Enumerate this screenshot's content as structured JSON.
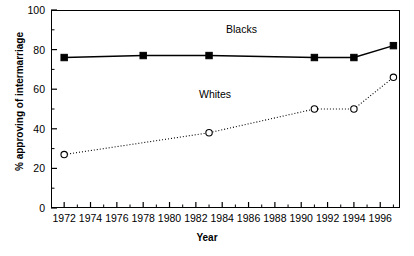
{
  "chart_data": {
    "type": "line",
    "title": "",
    "xlabel": "Year",
    "ylabel": "% approving of intermarriage",
    "xlim": [
      1971,
      1997.5
    ],
    "ylim": [
      0,
      100
    ],
    "grid": false,
    "legend_position": "inline-annotations",
    "x_major_ticks": [
      1972,
      1974,
      1976,
      1978,
      1980,
      1982,
      1984,
      1986,
      1988,
      1990,
      1992,
      1994,
      1996
    ],
    "x_minor_ticks": [
      1973,
      1975,
      1977,
      1979,
      1981,
      1983,
      1985,
      1987,
      1989,
      1991,
      1993,
      1995,
      1997
    ],
    "y_major_ticks": [
      0,
      20,
      40,
      60,
      80,
      100
    ],
    "y_minor_ticks": [
      10,
      30,
      50,
      70,
      90
    ],
    "x_tick_labels": [
      "1972",
      "1974",
      "1976",
      "1978",
      "1980",
      "1982",
      "1984",
      "1986",
      "1988",
      "1990",
      "1992",
      "1994",
      "1996"
    ],
    "y_tick_labels": [
      "0",
      "20",
      "40",
      "60",
      "80",
      "100"
    ],
    "series": [
      {
        "name": "Blacks",
        "marker": "filled-square",
        "line_style": "solid",
        "color": "#000000",
        "annotation": "Blacks",
        "x": [
          1972,
          1978,
          1983,
          1991,
          1994,
          1997
        ],
        "values": [
          76,
          77,
          77,
          76,
          76,
          82
        ]
      },
      {
        "name": "Whites",
        "marker": "open-circle",
        "line_style": "dotted",
        "color": "#000000",
        "annotation": "Whites",
        "x": [
          1972,
          1983,
          1991,
          1994,
          1997
        ],
        "values": [
          27,
          38,
          50,
          50,
          66
        ]
      }
    ]
  },
  "axes": {
    "y_title": "% approving of intermarriage",
    "x_title": "Year"
  },
  "annotations": {
    "blacks": "Blacks",
    "whites": "Whites"
  }
}
